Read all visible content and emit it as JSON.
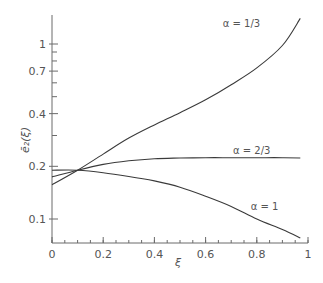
{
  "chart_data": {
    "type": "line",
    "title": "",
    "xlabel": "ξ",
    "ylabel": "ē₂(ξ)",
    "xscale": "linear",
    "yscale": "log",
    "xlim": [
      0,
      1
    ],
    "ylim": [
      0.065,
      1.6
    ],
    "grid": false,
    "legend": "none (inline curve labels)",
    "x_ticks": [
      0,
      0.2,
      0.4,
      0.6,
      0.8,
      1
    ],
    "x_tick_labels": [
      "0",
      "0.2",
      "0.4",
      "0.6",
      "0.8",
      "1"
    ],
    "x_minor_step": 0.05,
    "y_ticks_labeled": [
      0.1,
      0.2,
      0.4,
      0.7,
      1
    ],
    "y_tick_labels": [
      "0.1",
      "0.2",
      "0.4",
      "0.7",
      "1"
    ],
    "y_ticks_unlabeled": [
      0.3,
      0.5,
      0.6,
      0.8,
      0.9
    ],
    "series": [
      {
        "name": "α = 1/3",
        "label": "α = 1/3",
        "label_pos": [
          0.74,
          1.25
        ],
        "x": [
          0,
          0.1,
          0.2,
          0.3,
          0.4,
          0.5,
          0.6,
          0.7,
          0.8,
          0.9,
          0.97
        ],
        "y": [
          0.157,
          0.19,
          0.235,
          0.29,
          0.345,
          0.405,
          0.48,
          0.585,
          0.73,
          0.98,
          1.4
        ]
      },
      {
        "name": "α = 2/3",
        "label": "α = 2/3",
        "label_pos": [
          0.78,
          0.235
        ],
        "x": [
          0,
          0.1,
          0.2,
          0.3,
          0.4,
          0.5,
          0.6,
          0.7,
          0.8,
          0.9,
          0.97
        ],
        "y": [
          0.174,
          0.19,
          0.205,
          0.215,
          0.221,
          0.223,
          0.224,
          0.224,
          0.224,
          0.224,
          0.223
        ]
      },
      {
        "name": "α = 1",
        "label": "α = 1",
        "label_pos": [
          0.83,
          0.112
        ],
        "x": [
          0,
          0.1,
          0.2,
          0.3,
          0.4,
          0.5,
          0.6,
          0.7,
          0.8,
          0.9,
          0.97
        ],
        "y": [
          0.19,
          0.19,
          0.184,
          0.175,
          0.165,
          0.152,
          0.135,
          0.118,
          0.1,
          0.087,
          0.078
        ]
      }
    ]
  },
  "colors": {
    "axis": "#6b6b6b",
    "curve": "#3a3a3a",
    "text": "#555555"
  }
}
